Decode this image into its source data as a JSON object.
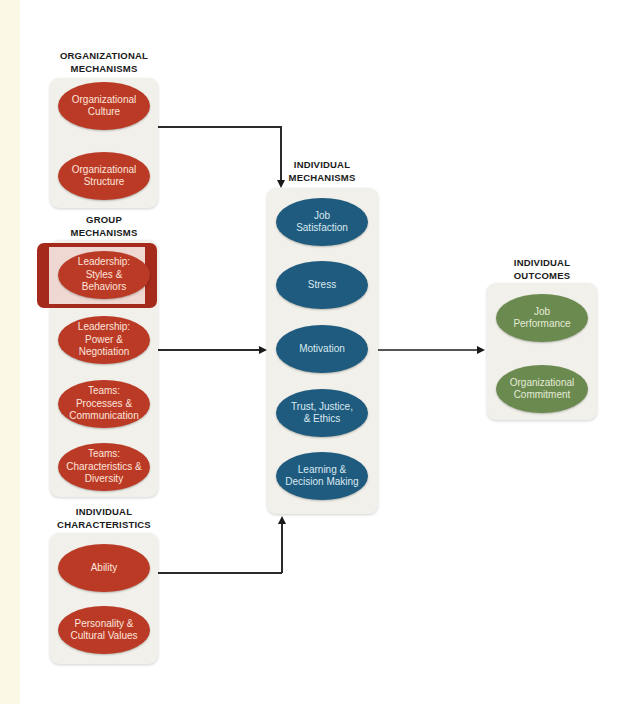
{
  "colors": {
    "organizational": "#bb3a26",
    "group": "#bb3a26",
    "individual_characteristics": "#bb3a26",
    "individual_mechanisms": "#1e5b7e",
    "individual_outcomes": "#6b8a4f",
    "highlight_border": "#a52a1c",
    "panel_background": "#f1f0ea"
  },
  "organizational_mechanisms": {
    "heading_line1": "ORGANIZATIONAL",
    "heading_line2": "MECHANISMS",
    "items": [
      {
        "line1": "Organizational",
        "line2": "Culture"
      },
      {
        "line1": "Organizational",
        "line2": "Structure"
      }
    ]
  },
  "group_mechanisms": {
    "heading_line1": "GROUP",
    "heading_line2": "MECHANISMS",
    "highlighted_index": 0,
    "items": [
      {
        "line1": "Leadership:",
        "line2": "Styles &",
        "line3": "Behaviors"
      },
      {
        "line1": "Leadership:",
        "line2": "Power &",
        "line3": "Negotiation"
      },
      {
        "line1": "Teams:",
        "line2": "Processes &",
        "line3": "Communication"
      },
      {
        "line1": "Teams:",
        "line2": "Characteristics &",
        "line3": "Diversity"
      }
    ]
  },
  "individual_characteristics": {
    "heading_line1": "INDIVIDUAL",
    "heading_line2": "CHARACTERISTICS",
    "items": [
      {
        "line1": "Ability"
      },
      {
        "line1": "Personality  &",
        "line2": "Cultural Values"
      }
    ]
  },
  "individual_mechanisms": {
    "heading_line1": "INDIVIDUAL",
    "heading_line2": "MECHANISMS",
    "items": [
      {
        "line1": "Job",
        "line2": "Satisfaction"
      },
      {
        "line1": "Stress"
      },
      {
        "line1": "Motivation"
      },
      {
        "line1": "Trust, Justice,",
        "line2": "& Ethics"
      },
      {
        "line1": "Learning &",
        "line2": "Decision Making"
      }
    ]
  },
  "individual_outcomes": {
    "heading_line1": "INDIVIDUAL",
    "heading_line2": "OUTCOMES",
    "items": [
      {
        "line1": "Job",
        "line2": "Performance"
      },
      {
        "line1": "Organizational",
        "line2": "Commitment"
      }
    ]
  },
  "connections": [
    {
      "from": "organizational_mechanisms",
      "to": "individual_mechanisms"
    },
    {
      "from": "group_mechanisms",
      "to": "individual_mechanisms"
    },
    {
      "from": "individual_characteristics",
      "to": "individual_mechanisms"
    },
    {
      "from": "individual_mechanisms",
      "to": "individual_outcomes"
    }
  ]
}
